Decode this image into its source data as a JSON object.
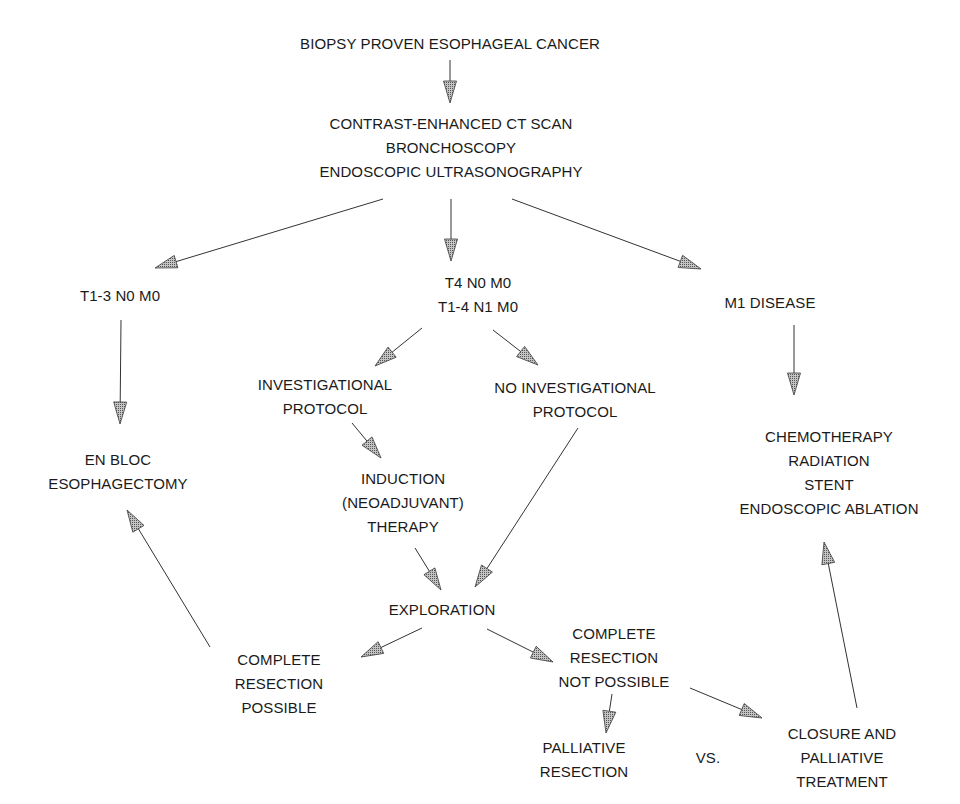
{
  "diagram": {
    "type": "flowchart",
    "line_color": "#333333",
    "arrowhead_fill": "#9a9a9a",
    "nodes": {
      "start": {
        "lines": [
          "BIOPSY PROVEN ESOPHAGEAL CANCER"
        ]
      },
      "staging": {
        "lines": [
          "CONTRAST-ENHANCED CT SCAN",
          "BRONCHOSCOPY",
          "ENDOSCOPIC ULTRASONOGRAPHY"
        ]
      },
      "t13": {
        "lines": [
          "T1-3 N0 M0"
        ]
      },
      "t4": {
        "lines": [
          "T4 N0 M0",
          "T1-4 N1 M0"
        ]
      },
      "m1": {
        "lines": [
          "M1 DISEASE"
        ]
      },
      "enbloc": {
        "lines": [
          "EN BLOC",
          "ESOPHAGECTOMY"
        ]
      },
      "invprot": {
        "lines": [
          "INVESTIGATIONAL",
          "PROTOCOL"
        ]
      },
      "noinvprot": {
        "lines": [
          "NO INVESTIGATIONAL",
          "PROTOCOL"
        ]
      },
      "palliation": {
        "lines": [
          "CHEMOTHERAPY",
          "RADIATION",
          "STENT",
          "ENDOSCOPIC ABLATION"
        ]
      },
      "induction": {
        "lines": [
          "INDUCTION",
          "(NEOADJUVANT)",
          "THERAPY"
        ]
      },
      "exploration": {
        "lines": [
          "EXPLORATION"
        ]
      },
      "crpossible": {
        "lines": [
          "COMPLETE",
          "RESECTION",
          "POSSIBLE"
        ]
      },
      "crnotpossible": {
        "lines": [
          "COMPLETE",
          "RESECTION",
          "NOT POSSIBLE"
        ]
      },
      "palres": {
        "lines": [
          "PALLIATIVE",
          "RESECTION"
        ]
      },
      "vs": {
        "lines": [
          "VS."
        ]
      },
      "closure": {
        "lines": [
          "CLOSURE AND",
          "PALLIATIVE",
          "TREATMENT"
        ]
      }
    },
    "edges": [
      {
        "from": "start",
        "to": "staging",
        "x1": 450,
        "y1": 60,
        "x2": 450,
        "y2": 103
      },
      {
        "from": "staging",
        "to": "t13",
        "x1": 383,
        "y1": 199,
        "x2": 155,
        "y2": 268
      },
      {
        "from": "staging",
        "to": "t4",
        "x1": 451,
        "y1": 199,
        "x2": 451,
        "y2": 261
      },
      {
        "from": "staging",
        "to": "m1",
        "x1": 512,
        "y1": 199,
        "x2": 701,
        "y2": 269
      },
      {
        "from": "t13",
        "to": "enbloc",
        "x1": 121,
        "y1": 320,
        "x2": 120,
        "y2": 424
      },
      {
        "from": "t4",
        "to": "invprot",
        "x1": 422,
        "y1": 328,
        "x2": 375,
        "y2": 366
      },
      {
        "from": "t4",
        "to": "noinvprot",
        "x1": 493,
        "y1": 330,
        "x2": 538,
        "y2": 365
      },
      {
        "from": "m1",
        "to": "palliation",
        "x1": 794,
        "y1": 325,
        "x2": 794,
        "y2": 395
      },
      {
        "from": "invprot",
        "to": "induction",
        "x1": 352,
        "y1": 423,
        "x2": 381,
        "y2": 458
      },
      {
        "from": "induction",
        "to": "exploration",
        "x1": 415,
        "y1": 548,
        "x2": 441,
        "y2": 590
      },
      {
        "from": "noinvprot",
        "to": "exploration",
        "x1": 578,
        "y1": 428,
        "x2": 475,
        "y2": 587
      },
      {
        "from": "exploration",
        "to": "crpossible",
        "x1": 422,
        "y1": 628,
        "x2": 361,
        "y2": 657
      },
      {
        "from": "exploration",
        "to": "crnotpossible",
        "x1": 487,
        "y1": 629,
        "x2": 553,
        "y2": 662
      },
      {
        "from": "crpossible",
        "to": "enbloc",
        "x1": 210,
        "y1": 647,
        "x2": 127,
        "y2": 510
      },
      {
        "from": "crnotpossible",
        "to": "palres",
        "x1": 612,
        "y1": 694,
        "x2": 606,
        "y2": 733
      },
      {
        "from": "crnotpossible",
        "to": "closure",
        "x1": 690,
        "y1": 688,
        "x2": 762,
        "y2": 718
      },
      {
        "from": "closure",
        "to": "palliation",
        "x1": 857,
        "y1": 708,
        "x2": 824,
        "y2": 542
      }
    ]
  }
}
